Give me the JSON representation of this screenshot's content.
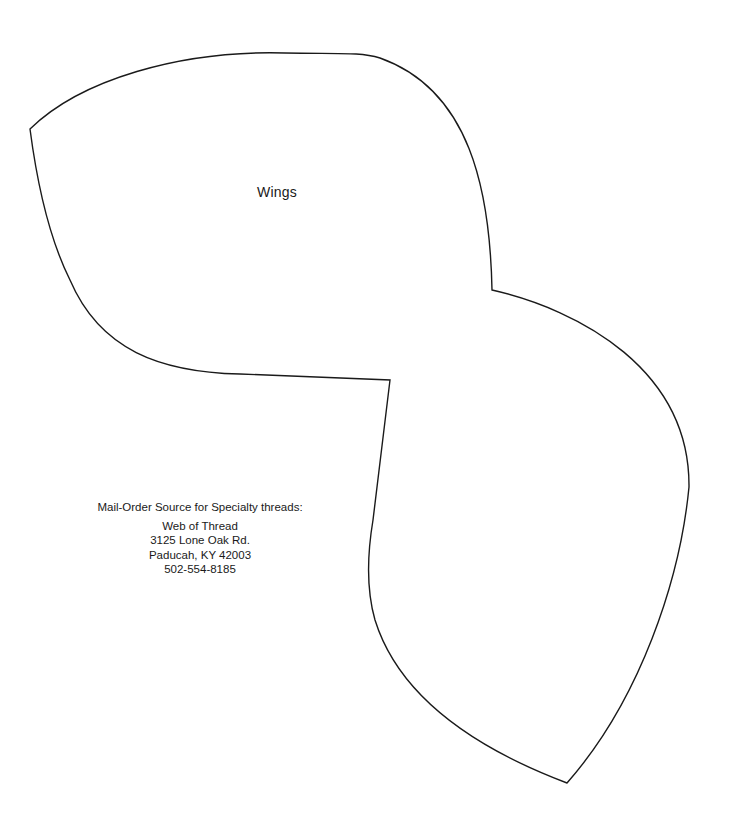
{
  "pattern": {
    "piece_label": "Wings",
    "outline_color": "#1a1a1a",
    "background_color": "#ffffff"
  },
  "source": {
    "heading": "Mail-Order Source for Specialty threads:",
    "name": "Web of Thread",
    "street": "3125 Lone Oak Rd.",
    "city_state_zip": "Paducah, KY 42003",
    "phone": "502-554-8185"
  }
}
